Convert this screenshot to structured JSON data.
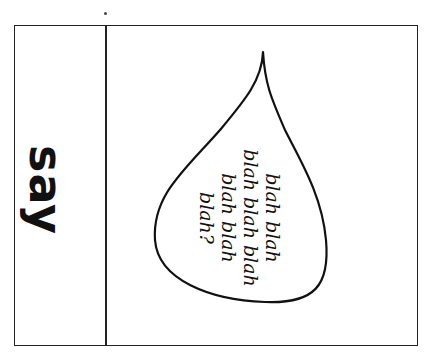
{
  "card": {
    "word": "say",
    "speech_bubble": {
      "lines": [
        "blah blah",
        "blah blah blah",
        "blah blah",
        "blah?"
      ]
    }
  },
  "colors": {
    "ink": "#111111",
    "background": "#ffffff"
  }
}
